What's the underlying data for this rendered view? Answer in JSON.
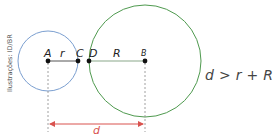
{
  "credit": "Ilustrações: ID/BR",
  "points": {
    "A": "A",
    "B": "B",
    "C": "C",
    "D": "D"
  },
  "segments": {
    "small_radius": "r",
    "large_radius": "R",
    "distance": "d"
  },
  "formula": "d > r + R",
  "colors": {
    "small_circle": "#7b9fd0",
    "large_circle": "#4f9a4f",
    "distance_arrow": "#d9534f",
    "radius_line": "#555555",
    "dashed": "#888888"
  },
  "geometry": {
    "small_circle": {
      "cx": 48,
      "cy": 61,
      "r": 30
    },
    "large_circle": {
      "cx": 145,
      "cy": 61,
      "r": 56
    }
  }
}
